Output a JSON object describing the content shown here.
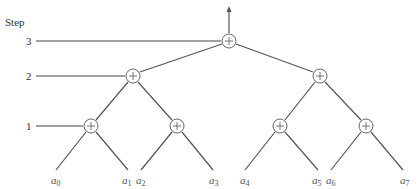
{
  "diagram": {
    "type": "binary-tree-reduction",
    "axis_title": "Step",
    "steps": [
      {
        "label": "3",
        "y": 41
      },
      {
        "label": "2",
        "y": 76
      },
      {
        "label": "1",
        "y": 126
      }
    ],
    "node_symbol": "+",
    "output_arrow": {
      "x": 229,
      "from_y": 33,
      "to_y": 8
    },
    "nodes": [
      {
        "id": "root",
        "step": 3,
        "x": 229,
        "y": 41
      },
      {
        "id": "s2-left",
        "step": 2,
        "x": 133,
        "y": 76
      },
      {
        "id": "s2-right",
        "step": 2,
        "x": 320,
        "y": 76
      },
      {
        "id": "s1-0",
        "step": 1,
        "x": 91,
        "y": 126
      },
      {
        "id": "s1-1",
        "step": 1,
        "x": 177,
        "y": 126
      },
      {
        "id": "s1-2",
        "step": 1,
        "x": 280,
        "y": 126
      },
      {
        "id": "s1-3",
        "step": 1,
        "x": 366,
        "y": 126
      }
    ],
    "leaves": [
      {
        "base": "a",
        "sub": "0",
        "x": 55
      },
      {
        "base": "a",
        "sub": "1",
        "x": 127
      },
      {
        "base": "a",
        "sub": "2",
        "x": 140
      },
      {
        "base": "a",
        "sub": "3",
        "x": 213
      },
      {
        "base": "a",
        "sub": "4",
        "x": 244
      },
      {
        "base": "a",
        "sub": "5",
        "x": 318
      },
      {
        "base": "a",
        "sub": "6",
        "x": 330
      },
      {
        "base": "a",
        "sub": "7",
        "x": 404
      }
    ],
    "colors": {
      "line": "#555555",
      "node_stroke": "#666666",
      "text": "#333333"
    }
  }
}
